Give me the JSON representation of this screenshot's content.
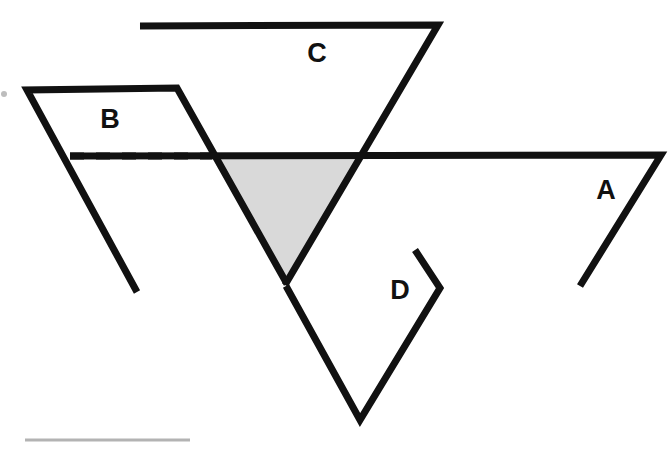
{
  "figure": {
    "canvas": {
      "width": 672,
      "height": 454,
      "background": "#ffffff"
    },
    "colors": {
      "stroke": "#111111",
      "shade_fill": "#d9d9d9",
      "shade_stroke": "#d9d9d9",
      "baseline_gray": "#b3b3b3",
      "background": "#ffffff"
    },
    "stroke_width": 7,
    "labels": [
      {
        "id": "label-a",
        "text": "A",
        "x": 606,
        "y": 192
      },
      {
        "id": "label-b",
        "text": "B",
        "x": 110,
        "y": 121
      },
      {
        "id": "label-c",
        "text": "C",
        "x": 317,
        "y": 55
      },
      {
        "id": "label-d",
        "text": "D",
        "x": 400,
        "y": 292
      }
    ],
    "shapes": [
      {
        "id": "shape-c",
        "label": "C",
        "kind": "open-polyline",
        "description": "Horizontal top segment running right, then a long edge descending to the lower left.",
        "points": "140,26 438,25 285,285"
      },
      {
        "id": "shape-b",
        "label": "B",
        "kind": "open-polyline",
        "description": "Horizontal top segment with slanted left edge descending and right edge descending to the lower right.",
        "points": "137,292 27,90 177,88 287,284"
      },
      {
        "id": "shape-a",
        "label": "A",
        "kind": "open-polyline",
        "description": "Long horizontal line across the figure, turning down-left at its right end.",
        "points": "70,156 661,155 580,286"
      },
      {
        "id": "shape-d",
        "label": "D",
        "kind": "open-polyline",
        "description": "Short upper segment meeting a vertex, then a long edge descending left to a V bottom and up to the left.",
        "points": "415,250 440,288 360,420 286,286"
      }
    ],
    "dashed_segment": {
      "id": "dashed-line",
      "description": "Dashed horizontal construction line inside shape B, level with line A.",
      "x1": 70,
      "y1": 156,
      "x2": 212,
      "y2": 156,
      "dash": "14 12"
    },
    "shaded_region": {
      "id": "shaded-triangle",
      "description": "Inverted triangle bounded by line A on top, B right edge on the left, and C descending edge on the right.",
      "points": "212,157 358,157 286,283",
      "fill": "#d9d9d9"
    },
    "baseline_rule": {
      "id": "baseline-rule",
      "description": "Faint gray horizontal rule near the bottom left margin.",
      "x1": 25,
      "y1": 440,
      "x2": 190,
      "y2": 440,
      "color": "#b3b3b3",
      "width": 3
    },
    "margin_mark": {
      "id": "margin-mark",
      "description": "Small faint mark at the far left edge.",
      "cx": 4,
      "cy": 94,
      "r": 3,
      "color": "#bdbdbd"
    }
  }
}
